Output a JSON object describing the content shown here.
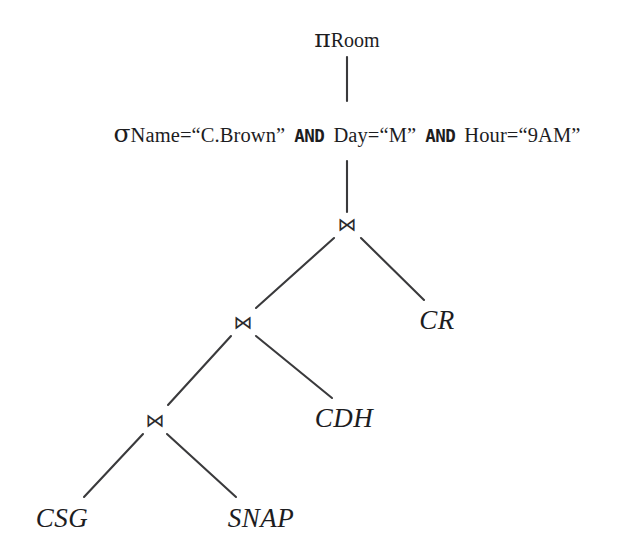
{
  "diagram": {
    "type": "query-tree",
    "background_color": "#ffffff",
    "ink_color": "#1d1d1f",
    "nodes": {
      "projection": {
        "symbol": "π",
        "subscript": "Room",
        "kind": "projection",
        "x": 347,
        "y": 38
      },
      "selection": {
        "symbol": "σ",
        "kind": "selection",
        "x": 347,
        "y": 133,
        "condition_text": "Name=“C.Brown” AND Day=“M” AND Hour=“9AM”",
        "parts": [
          {
            "text": "Name=“C.Brown”",
            "style": "plain"
          },
          {
            "text": "AND",
            "style": "bold-mono"
          },
          {
            "text": "Day=“M”",
            "style": "plain"
          },
          {
            "text": "AND",
            "style": "bold-mono"
          },
          {
            "text": "Hour=“9AM”",
            "style": "plain"
          }
        ]
      },
      "join_top": {
        "symbol": "⋈",
        "kind": "natural-join",
        "x": 347,
        "y": 224
      },
      "join_mid": {
        "symbol": "⋈",
        "kind": "natural-join",
        "x": 243,
        "y": 322
      },
      "join_low": {
        "symbol": "⋈",
        "kind": "natural-join",
        "x": 155,
        "y": 420
      },
      "rel_cr": {
        "label": "CR",
        "kind": "relation",
        "x": 437,
        "y": 320
      },
      "rel_cdh": {
        "label": "CDH",
        "kind": "relation",
        "x": 344,
        "y": 418
      },
      "rel_csg": {
        "label": "CSG",
        "kind": "relation",
        "x": 62,
        "y": 518
      },
      "rel_snap": {
        "label": "SNAP",
        "kind": "relation",
        "x": 261,
        "y": 518
      }
    },
    "edges": [
      {
        "from": "projection",
        "to": "selection",
        "shape": "vertical",
        "x1": 347,
        "y1": 57,
        "x2": 347,
        "y2": 101
      },
      {
        "from": "selection",
        "to": "join_top",
        "shape": "vertical",
        "x1": 347,
        "y1": 161,
        "x2": 347,
        "y2": 212
      },
      {
        "from": "join_top",
        "to": "join_mid",
        "shape": "diagonal",
        "x1": 334,
        "y1": 238,
        "x2": 256,
        "y2": 308
      },
      {
        "from": "join_top",
        "to": "rel_cr",
        "shape": "diagonal",
        "x1": 361,
        "y1": 238,
        "x2": 424,
        "y2": 300
      },
      {
        "from": "join_mid",
        "to": "join_low",
        "shape": "diagonal",
        "x1": 231,
        "y1": 336,
        "x2": 168,
        "y2": 405
      },
      {
        "from": "join_mid",
        "to": "rel_cdh",
        "shape": "diagonal",
        "x1": 256,
        "y1": 336,
        "x2": 332,
        "y2": 398
      },
      {
        "from": "join_low",
        "to": "rel_csg",
        "shape": "diagonal",
        "x1": 143,
        "y1": 434,
        "x2": 84,
        "y2": 497
      },
      {
        "from": "join_low",
        "to": "rel_snap",
        "shape": "diagonal",
        "x1": 167,
        "y1": 434,
        "x2": 236,
        "y2": 497
      }
    ]
  }
}
